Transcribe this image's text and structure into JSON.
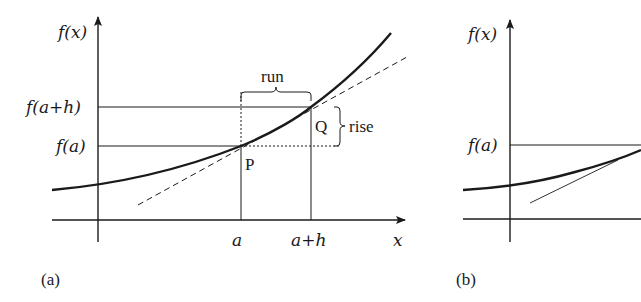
{
  "panels": [
    {
      "id": "a",
      "caption": "(a)",
      "y_axis_label": "f(x)",
      "x_axis_label": "x",
      "y_ticks": [
        "f(a+h)",
        "f(a)"
      ],
      "x_ticks": [
        "a",
        "a+h"
      ],
      "points": {
        "p": "P",
        "q": "Q"
      },
      "annotations": {
        "run": "run",
        "rise": "rise"
      },
      "curve": "f(x) increasing convex curve",
      "secant_or_tangent": "dashed line through P and Q"
    },
    {
      "id": "b",
      "caption": "(b)",
      "y_axis_label": "f(x)",
      "y_ticks": [
        "f(a)"
      ],
      "curve": "f(x) increasing convex curve (cropped)",
      "tangent": "thin tangent line"
    }
  ],
  "colors": {
    "ink": "#1a1a1a",
    "background": "#ffffff"
  }
}
